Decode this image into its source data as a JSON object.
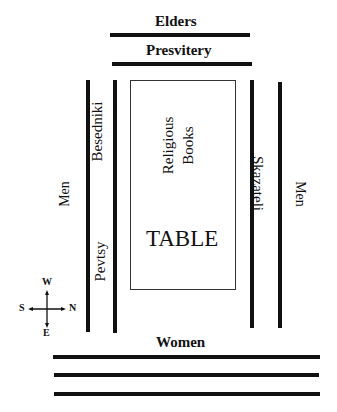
{
  "diagram": {
    "top": {
      "elders": "Elders",
      "presvitery": "Presvitery"
    },
    "left": {
      "men": "Men",
      "besedniki": "Besedniki",
      "pevtsy": "Pevtsy"
    },
    "center": {
      "religious_books_line1": "Religious",
      "religious_books_line2": "Books",
      "table": "TABLE"
    },
    "right": {
      "skazateli": "Skazateli",
      "men": "Men"
    },
    "bottom": {
      "women": "Women"
    },
    "compass": {
      "north": "N",
      "south": "S",
      "east": "E",
      "west": "W"
    }
  },
  "colors": {
    "line": "#111111",
    "background": "#ffffff"
  }
}
